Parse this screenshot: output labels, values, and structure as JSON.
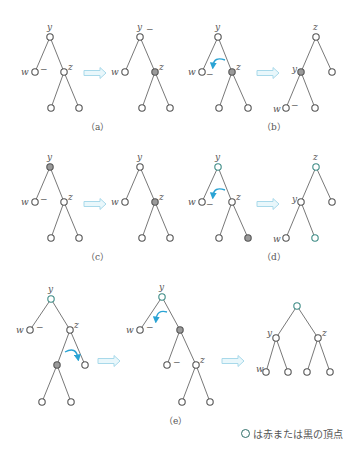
{
  "figure": {
    "colors": {
      "edge": "#555555",
      "node_stroke": "#555555",
      "node_fill": "#ffffff",
      "node_gray": "#9a9a9a",
      "node_teal": "#3e8c86",
      "arrow": "#bfe6f2",
      "rotate_arrow": "#2aa3d4"
    },
    "panels": [
      {
        "id": "a",
        "caption": "（a）"
      },
      {
        "id": "b",
        "caption": "（b）"
      },
      {
        "id": "c",
        "caption": "（c）"
      },
      {
        "id": "d",
        "caption": "（d）"
      },
      {
        "id": "e",
        "caption": "（e）"
      }
    ],
    "labels": {
      "w": "w",
      "y": "y",
      "z": "z",
      "minus": "−"
    }
  },
  "legend": {
    "icon": "circle-node-icon",
    "text": "は赤または黒の頂点"
  }
}
